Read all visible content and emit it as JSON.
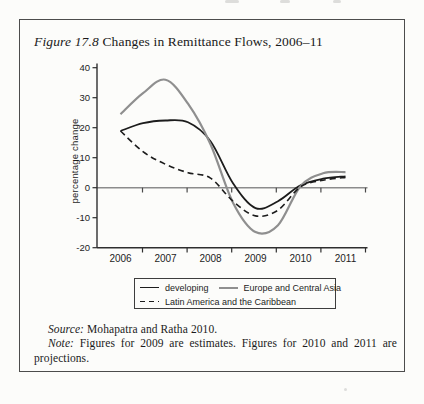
{
  "title": {
    "label_italic": "Figure 17.8",
    "label_rest": " Changes in Remittance Flows, 2006–11"
  },
  "notes": {
    "source_label": "Source:",
    "source_rest": " Mohapatra and Ratha 2010.",
    "note_label": "Note:",
    "note_line1_rest": " Figures for 2009 are estimates. Figures for 2010 and 2011 are",
    "note_line2": "projections."
  },
  "legend": {
    "items": [
      {
        "label": "developing",
        "style": "solid",
        "color": "#1c1c1c"
      },
      {
        "label": "Europe and Central Asia",
        "style": "solid",
        "color": "#8f8f8f"
      },
      {
        "label": "Latin America and the Caribbean",
        "style": "dashed",
        "color": "#1c1c1c"
      }
    ]
  },
  "chart_data": {
    "type": "line",
    "title": "Changes in Remittance Flows, 2006–11",
    "xlabel": "",
    "ylabel": "percentage change",
    "ylim": [
      -20,
      40
    ],
    "yticks": [
      40,
      30,
      20,
      10,
      0,
      -10,
      -20
    ],
    "xtick_labels": [
      "2006",
      "2007",
      "2008",
      "2009",
      "2010",
      "2011"
    ],
    "grid": false,
    "zero_line": true,
    "legend_position": "bottom",
    "x": [
      2006,
      2006.5,
      2007,
      2007.5,
      2008,
      2008.5,
      2009,
      2009.5,
      2010,
      2010.5,
      2011
    ],
    "series": [
      {
        "name": "developing",
        "color": "#1c1c1c",
        "width": 1.8,
        "dash": null,
        "values": [
          18.9,
          21.5,
          22.4,
          21.8,
          15.5,
          1.5,
          -6.8,
          -4.5,
          0.8,
          3.0,
          3.8
        ]
      },
      {
        "name": "Europe and Central Asia",
        "color": "#8f8f8f",
        "width": 2.2,
        "dash": null,
        "values": [
          24.5,
          31.5,
          36.0,
          28.0,
          14.5,
          -5.0,
          -14.8,
          -12.5,
          0.5,
          4.8,
          5.2
        ]
      },
      {
        "name": "Latin America and the Caribbean",
        "color": "#1c1c1c",
        "width": 1.6,
        "dash": "6 4",
        "values": [
          18.9,
          12.0,
          7.8,
          5.0,
          3.2,
          -4.5,
          -9.4,
          -7.5,
          0.3,
          2.5,
          3.4
        ]
      }
    ]
  }
}
